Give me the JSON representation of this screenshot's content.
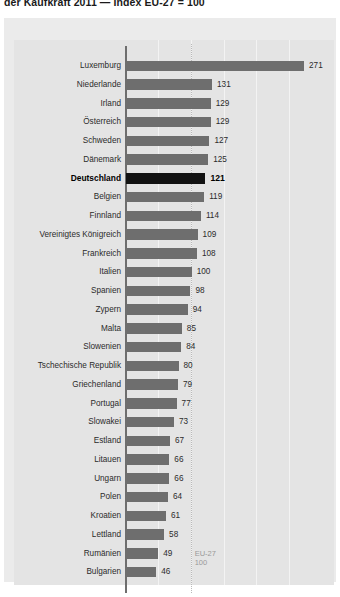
{
  "title": "der Kaufkraft 2011 — Index EU-27 = 100",
  "reference": {
    "line_label_1": "EU-27",
    "line_label_2": "100",
    "value": 100
  },
  "colors": {
    "panel": "#ebebeb",
    "plot": "#e4e4e4",
    "bar": "#6e6e6e",
    "bar_highlight": "#121212",
    "axis": "#6e6e6e",
    "refline": "#b9b9b9",
    "text": "#2b2b2b"
  },
  "chart_data": {
    "type": "bar",
    "orientation": "horizontal",
    "title": "der Kaufkraft 2011 — Index EU-27 = 100",
    "xlabel": "",
    "ylabel": "",
    "xlim": [
      0,
      280
    ],
    "grid": true,
    "legend": false,
    "annotations": [
      "EU-27 100"
    ],
    "highlight": "Deutschland",
    "categories": [
      "Luxemburg",
      "Niederlande",
      "Irland",
      "Österreich",
      "Schweden",
      "Dänemark",
      "Deutschland",
      "Belgien",
      "Finnland",
      "Vereinigtes Königreich",
      "Frankreich",
      "Italien",
      "Spanien",
      "Zypern",
      "Malta",
      "Slowenien",
      "Tschechische Republik",
      "Griechenland",
      "Portugal",
      "Slowakei",
      "Estland",
      "Litauen",
      "Ungarn",
      "Polen",
      "Kroatien",
      "Lettland",
      "Rumänien",
      "Bulgarien"
    ],
    "values": [
      271,
      131,
      129,
      129,
      127,
      125,
      121,
      119,
      114,
      109,
      108,
      100,
      98,
      94,
      85,
      84,
      80,
      79,
      77,
      73,
      67,
      66,
      66,
      64,
      61,
      58,
      49,
      46
    ]
  }
}
